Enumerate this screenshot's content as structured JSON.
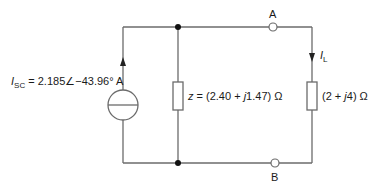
{
  "diagram": {
    "type": "circuit",
    "wire_color": "#6b6b6b",
    "source": {
      "kind": "current-source",
      "symbol": "I",
      "subscript": "SC",
      "equals": " = 2.185",
      "angle_symbol": "∠",
      "angle": "−43.96° A"
    },
    "internal_impedance": {
      "symbol": "z",
      "value": " = (2.40 + ",
      "j": "j",
      "imag": "1.47) Ω"
    },
    "load": {
      "current_symbol": "I",
      "current_subscript": "L",
      "value_pre": "(2 + ",
      "j": "j",
      "value_post": "4) Ω"
    },
    "terminals": {
      "a": "A",
      "b": "B"
    }
  }
}
